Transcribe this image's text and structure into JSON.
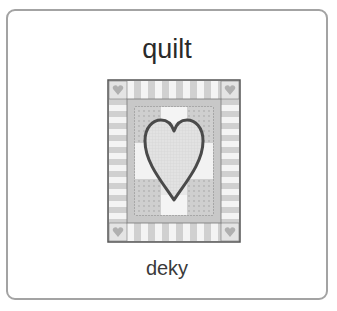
{
  "card": {
    "word": "quilt",
    "translation": "deky",
    "image": {
      "icon": "quilt-with-heart-illustration",
      "colors": {
        "outline": "#555555",
        "light": "#f4f4f4",
        "mid": "#cfcfcf",
        "dark": "#a8a8a8",
        "heart": "#dedede"
      }
    },
    "border_color": "#a3a3a3"
  }
}
